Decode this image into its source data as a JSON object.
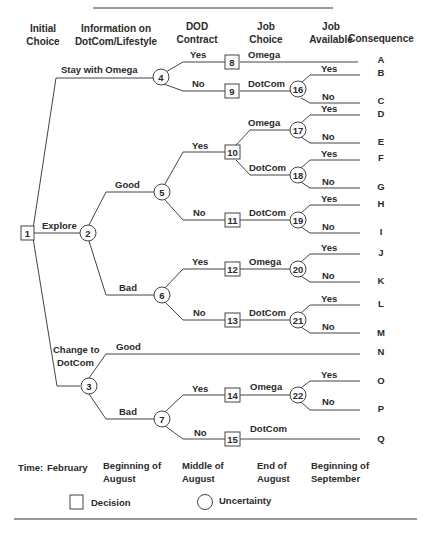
{
  "headers": {
    "initial_choice": [
      "Initial",
      "Choice"
    ],
    "information": [
      "Information on",
      "DotCom/Lifestyle"
    ],
    "dod_contract": [
      "DOD",
      "Contract"
    ],
    "job_choice": [
      "Job",
      "Choice"
    ],
    "job_available": [
      "Job",
      "Available"
    ],
    "consequence": "Consequence"
  },
  "nodes": {
    "1": {
      "type": "decision",
      "label": "1"
    },
    "2": {
      "type": "uncertainty",
      "label": "2"
    },
    "3": {
      "type": "uncertainty",
      "label": "3"
    },
    "4": {
      "type": "uncertainty",
      "label": "4"
    },
    "5": {
      "type": "uncertainty",
      "label": "5"
    },
    "6": {
      "type": "uncertainty",
      "label": "6"
    },
    "7": {
      "type": "uncertainty",
      "label": "7"
    },
    "8": {
      "type": "decision",
      "label": "8"
    },
    "9": {
      "type": "decision",
      "label": "9"
    },
    "10": {
      "type": "decision",
      "label": "10"
    },
    "11": {
      "type": "decision",
      "label": "11"
    },
    "12": {
      "type": "decision",
      "label": "12"
    },
    "13": {
      "type": "decision",
      "label": "13"
    },
    "14": {
      "type": "decision",
      "label": "14"
    },
    "15": {
      "type": "decision",
      "label": "15"
    },
    "16": {
      "type": "uncertainty",
      "label": "16"
    },
    "17": {
      "type": "uncertainty",
      "label": "17"
    },
    "18": {
      "type": "uncertainty",
      "label": "18"
    },
    "19": {
      "type": "uncertainty",
      "label": "19"
    },
    "20": {
      "type": "uncertainty",
      "label": "20"
    },
    "21": {
      "type": "uncertainty",
      "label": "21"
    },
    "22": {
      "type": "uncertainty",
      "label": "22"
    }
  },
  "branches": {
    "stay_with_omega": "Stay with Omega",
    "explore": "Explore",
    "change_to_dotcom": [
      "Change to",
      "DotCom"
    ],
    "good": "Good",
    "bad": "Bad",
    "yes": "Yes",
    "no": "No",
    "omega": "Omega",
    "dotcom": "DotCom"
  },
  "consequences": [
    "A",
    "B",
    "C",
    "D",
    "E",
    "F",
    "G",
    "H",
    "I",
    "J",
    "K",
    "L",
    "M",
    "N",
    "O",
    "P",
    "Q"
  ],
  "timeline": {
    "label": "Time:",
    "periods": [
      [
        "February"
      ],
      [
        "Beginning of",
        "August"
      ],
      [
        "Middle of",
        "August"
      ],
      [
        "End of",
        "August"
      ],
      [
        "Beginning of",
        "September"
      ]
    ]
  },
  "legend": {
    "decision": "Decision",
    "uncertainty": "Uncertainty"
  }
}
